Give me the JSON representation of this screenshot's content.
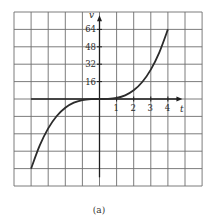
{
  "chart_data": {
    "type": "line",
    "title": "",
    "caption": "(a)",
    "xlabel": "t",
    "ylabel": "v",
    "function": "v = t^3",
    "x": [
      -4,
      -3.5,
      -3,
      -2.5,
      -2,
      -1.5,
      -1,
      -0.5,
      0,
      0.5,
      1,
      1.5,
      2,
      2.5,
      3,
      3.5,
      4
    ],
    "series": [
      {
        "name": "v",
        "values": [
          -64,
          -42.875,
          -27,
          -15.625,
          -8,
          -3.375,
          -1,
          -0.125,
          0,
          0.125,
          1,
          3.375,
          8,
          15.625,
          27,
          42.875,
          64
        ]
      }
    ],
    "xticks": [
      "1",
      "2",
      "3",
      "4"
    ],
    "yticks": [
      "16",
      "32",
      "48",
      "64"
    ],
    "xlim": [
      -5,
      6
    ],
    "ylim": [
      -80,
      80
    ],
    "grid": true,
    "legend": null
  },
  "colors": {
    "grid": "#6e6e6e",
    "axis": "#1e1e1e",
    "curve": "#2b2b2b",
    "text": "#2a2a2a"
  }
}
